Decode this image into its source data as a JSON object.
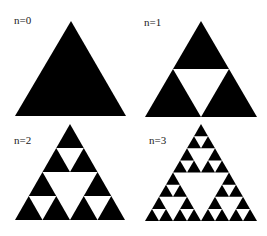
{
  "diagram": {
    "fill_color": "#000000",
    "hole_color": "#ffffff",
    "background": "#ffffff",
    "panels": [
      {
        "label": "n=0",
        "iterations": 0,
        "label_pos": [
          14,
          24
        ],
        "triangle": {
          "apex": [
            71,
            21
          ],
          "left": [
            15,
            116
          ],
          "right": [
            126,
            116
          ]
        }
      },
      {
        "label": "n=1",
        "iterations": 1,
        "label_pos": [
          144,
          26
        ],
        "triangle": {
          "apex": [
            201,
            21
          ],
          "left": [
            145,
            117
          ],
          "right": [
            257,
            117
          ]
        }
      },
      {
        "label": "n=2",
        "iterations": 2,
        "label_pos": [
          14,
          144
        ],
        "triangle": {
          "apex": [
            70,
            124
          ],
          "left": [
            15,
            220
          ],
          "right": [
            125,
            220
          ]
        }
      },
      {
        "label": "n=3",
        "iterations": 3,
        "label_pos": [
          149,
          144
        ],
        "triangle": {
          "apex": [
            201,
            124
          ],
          "left": [
            145,
            221
          ],
          "right": [
            257,
            221
          ]
        }
      }
    ]
  }
}
